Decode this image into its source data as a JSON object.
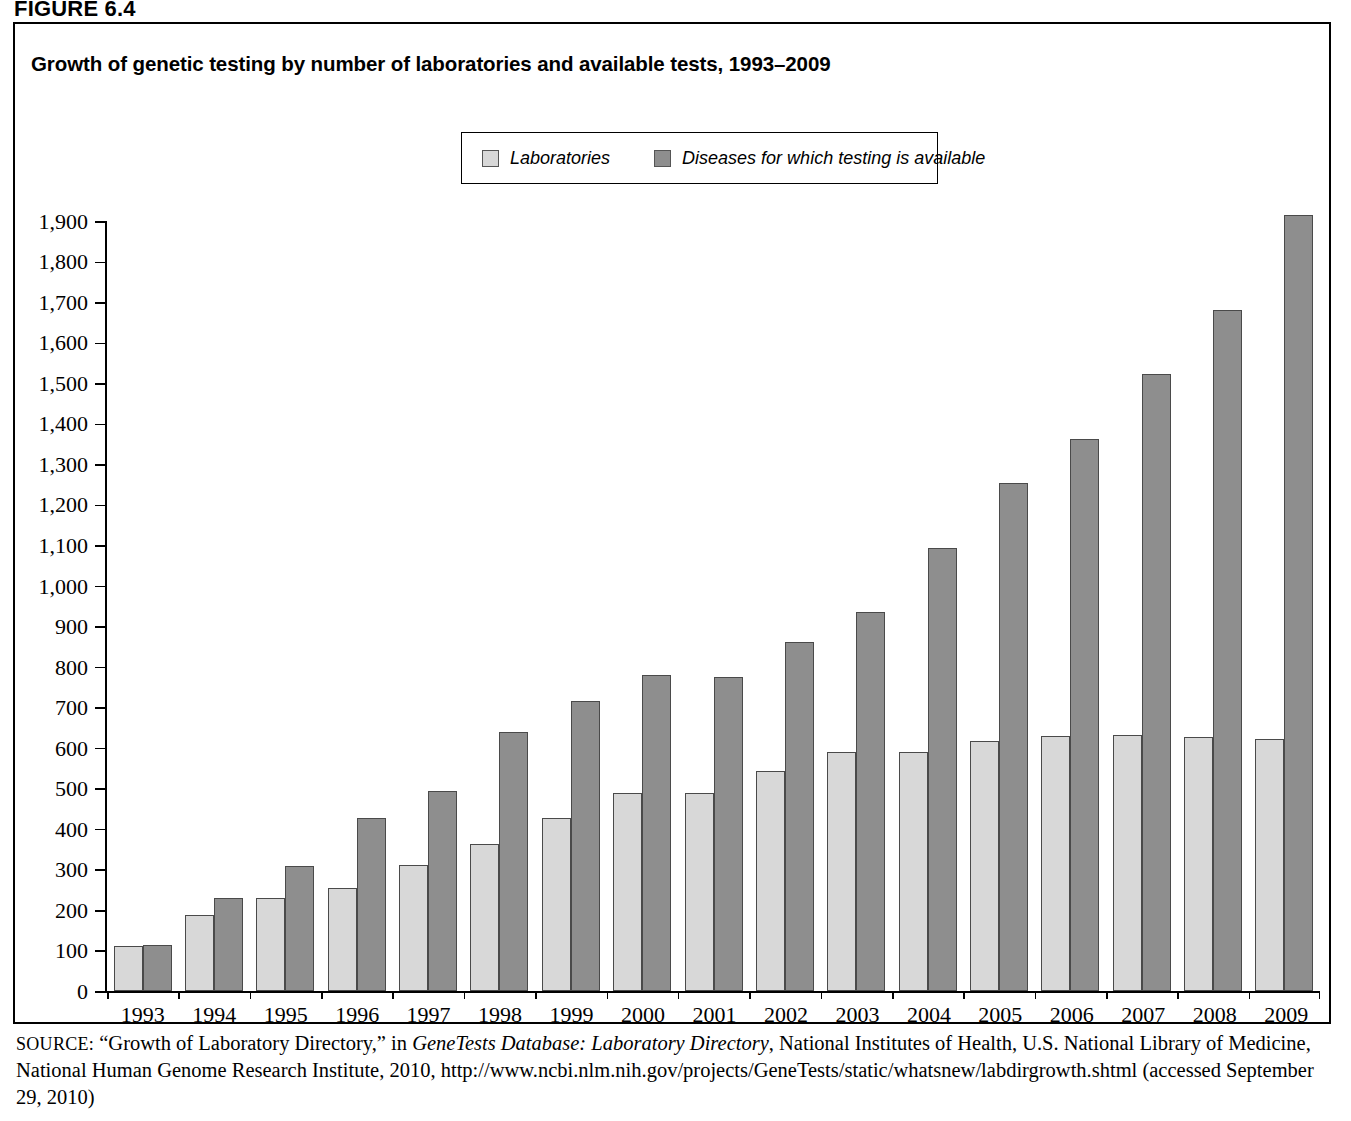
{
  "figure": {
    "label": "FIGURE 6.4",
    "title": "Growth of genetic testing by number of laboratories and available tests, 1993–2009"
  },
  "legend": {
    "items": [
      {
        "label": "Laboratories",
        "color": "#d8d8d8"
      },
      {
        "label": "Diseases for which testing is available",
        "color": "#8e8e8e"
      }
    ]
  },
  "source": {
    "prefix": "SOURCE:",
    "part1": " “Growth of Laboratory Directory,” in ",
    "italic1": "GeneTests Database: Laboratory Directory",
    "part2": ", National Institutes of Health, U.S. National Library of Medicine, National Human Genome Research Institute, 2010, http://www.ncbi.nlm.nih.gov/projects/GeneTests/static/whatsnew/labdirgrowth.shtml (accessed September 29, 2010)"
  },
  "chart_data": {
    "type": "bar",
    "title": "Growth of genetic testing by number of laboratories and available tests, 1993–2009",
    "xlabel": "",
    "ylabel": "",
    "ylim": [
      0,
      1900
    ],
    "ytick_step": 100,
    "grid": false,
    "legend_position": "top-center",
    "ytick_labels": [
      "1,900",
      "1,800",
      "1,700",
      "1,600",
      "1,500",
      "1,400",
      "1,300",
      "1,200",
      "1,100",
      "1,000",
      "900",
      "800",
      "700",
      "600",
      "500",
      "400",
      "300",
      "200",
      "100",
      "0"
    ],
    "categories": [
      "1993",
      "1994",
      "1995",
      "1996",
      "1997",
      "1998",
      "1999",
      "2000",
      "2001",
      "2002",
      "2003",
      "2004",
      "2005",
      "2006",
      "2007",
      "2008",
      "2009"
    ],
    "series": [
      {
        "name": "Laboratories",
        "color": "#d8d8d8",
        "values": [
          112,
          188,
          229,
          255,
          310,
          363,
          427,
          489,
          488,
          543,
          590,
          591,
          618,
          629,
          631,
          627,
          623
        ]
      },
      {
        "name": "Diseases for which testing is available",
        "color": "#8e8e8e",
        "values": [
          113,
          229,
          309,
          427,
          494,
          638,
          716,
          781,
          775,
          861,
          936,
          1092,
          1254,
          1363,
          1522,
          1681,
          1914
        ]
      }
    ]
  }
}
